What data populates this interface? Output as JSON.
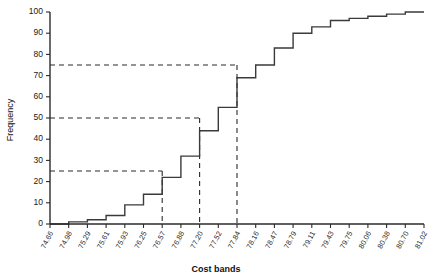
{
  "chart_data": {
    "type": "line",
    "title": "",
    "subtitle": "",
    "xlabel": "Cost bands",
    "ylabel": "Frequency",
    "ylim": [
      0,
      100
    ],
    "ytick_step": 10,
    "grid": false,
    "legend": "none",
    "series_name": "Cumulative frequency",
    "style": "ogive-step",
    "categories": [
      "74.66",
      "74.98",
      "75.29",
      "75.61",
      "75.93",
      "76.25",
      "76.57",
      "76.88",
      "77.20",
      "77.52",
      "77.84",
      "78.16",
      "78.47",
      "78.79",
      "79.11",
      "79.43",
      "79.75",
      "80.06",
      "80.38",
      "80.70",
      "81.02"
    ],
    "values": [
      0,
      1,
      2,
      4,
      9,
      14,
      22,
      32,
      44,
      55,
      69,
      75,
      83,
      90,
      93,
      96,
      97,
      98,
      99,
      100,
      100
    ],
    "yticks": [
      0,
      10,
      20,
      30,
      40,
      50,
      60,
      70,
      80,
      90,
      100
    ],
    "annotations": {
      "horizontal_guides": [
        75,
        50,
        25
      ],
      "vertical_guides": [
        "77.84",
        "77.20",
        "76.57"
      ],
      "description": "Quartile construction lines at cumulative frequency 25, 50 and 75"
    }
  },
  "axes": {
    "y_axis_title": "Frequency",
    "x_axis_title": "Cost bands"
  }
}
